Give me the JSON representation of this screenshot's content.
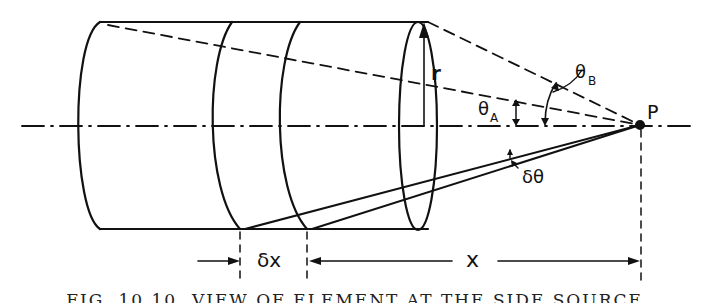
{
  "figure": {
    "labels": {
      "radius": "r",
      "theta_a": "θ",
      "theta_a_sub": "A",
      "theta_b": "θ",
      "theta_b_sub": "B",
      "point": "P",
      "delta_theta": "δθ",
      "delta_x": "δx",
      "x": "x"
    },
    "caption": "FIG. 10.10. VIEW OF ELEMENT AT THE SIDE SOURCE"
  },
  "colors": {
    "ink": "#111111",
    "paper": "#ffffff"
  }
}
